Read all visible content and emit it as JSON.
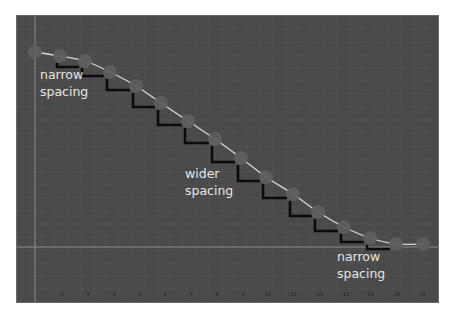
{
  "diagram": {
    "colors": {
      "background": "#4a4a4a",
      "grid_minor": "#555555",
      "axis_line": "#8a8a8a",
      "curve": "#d8d8d8",
      "dot": "#5e5e5e",
      "bracket": "#0b0b0b",
      "label_text": "#e6e6e6"
    },
    "annotations": [
      {
        "text_line1": "narrow",
        "text_line2": "spacing",
        "x": 40,
        "y": 66
      },
      {
        "text_line1": "wider",
        "text_line2": "spacing",
        "x": 185,
        "y": 165
      },
      {
        "text_line1": "narrow",
        "text_line2": "spacing",
        "x": 337,
        "y": 248
      }
    ],
    "frame_numbers": [
      "2",
      "3",
      "4",
      "5",
      "6",
      "7",
      "8",
      "9",
      "10",
      "11",
      "12",
      "13",
      "14",
      "15",
      "16"
    ],
    "frame_number_x": [
      62,
      88,
      114,
      140,
      165,
      191,
      217,
      243,
      268,
      294,
      320,
      346,
      371,
      397,
      423
    ],
    "dots": [
      {
        "x": 35,
        "y": 52
      },
      {
        "x": 60,
        "y": 56
      },
      {
        "x": 85,
        "y": 61
      },
      {
        "x": 110,
        "y": 72
      },
      {
        "x": 136,
        "y": 86
      },
      {
        "x": 161,
        "y": 103
      },
      {
        "x": 188,
        "y": 121
      },
      {
        "x": 215,
        "y": 139
      },
      {
        "x": 241,
        "y": 158
      },
      {
        "x": 266,
        "y": 177
      },
      {
        "x": 293,
        "y": 194
      },
      {
        "x": 318,
        "y": 212
      },
      {
        "x": 344,
        "y": 227
      },
      {
        "x": 370,
        "y": 238
      },
      {
        "x": 396,
        "y": 244
      },
      {
        "x": 423,
        "y": 244
      }
    ],
    "axis_vertical_x": 35,
    "axis_horizontal_y": 247
  }
}
